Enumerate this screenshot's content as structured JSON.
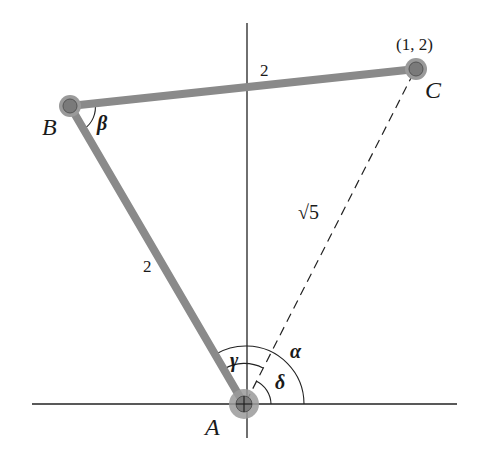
{
  "diagram": {
    "points": {
      "A": {
        "label": "A",
        "x": 244,
        "y": 404
      },
      "B": {
        "label": "B",
        "x": 70,
        "y": 106
      },
      "C": {
        "label": "C",
        "x": 416,
        "y": 69,
        "coord_label": "(1, 2)"
      }
    },
    "segments": {
      "AB": {
        "length_label": "2",
        "style": "rod"
      },
      "BC": {
        "length_label": "2",
        "style": "rod"
      },
      "AC": {
        "length_label": "√5",
        "style": "dashed"
      }
    },
    "angles": {
      "alpha": "α",
      "beta": "β",
      "gamma": "γ",
      "delta": "δ"
    },
    "colors": {
      "rod": "#8a8a8a",
      "joint_outer": "#9a9a9a",
      "joint_inner": "#7a7a7a",
      "axis": "#222222",
      "text": "#1a1a1a"
    }
  }
}
